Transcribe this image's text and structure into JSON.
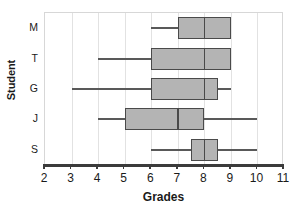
{
  "chart_data": {
    "type": "box",
    "title": "",
    "xlabel": "Grades",
    "ylabel": "Student",
    "orientation": "horizontal",
    "xlim": [
      2,
      11
    ],
    "xticks": [
      2,
      3,
      4,
      5,
      6,
      7,
      8,
      9,
      10,
      11
    ],
    "xtick_labels": [
      "2",
      "3",
      "4",
      "5",
      "6",
      "7",
      "8",
      "9",
      "10",
      "11"
    ],
    "grid": true,
    "legend": "none",
    "categories": [
      "M",
      "T",
      "G",
      "J",
      "S"
    ],
    "boxes": [
      {
        "category": "M",
        "whisker_low": 6,
        "q1": 7,
        "median": 8,
        "q3": 9,
        "whisker_high": 9
      },
      {
        "category": "T",
        "whisker_low": 4,
        "q1": 6,
        "median": 8,
        "q3": 9,
        "whisker_high": 9
      },
      {
        "category": "G",
        "whisker_low": 3,
        "q1": 6,
        "median": 8,
        "q3": 8.5,
        "whisker_high": 9
      },
      {
        "category": "J",
        "whisker_low": 4,
        "q1": 5,
        "median": 7,
        "q3": 8,
        "whisker_high": 10
      },
      {
        "category": "S",
        "whisker_low": 6,
        "q1": 7.5,
        "median": 8,
        "q3": 8.5,
        "whisker_high": 10
      }
    ],
    "colors": {
      "box_fill": "#b4b4b4",
      "box_edge": "#4a4a4a",
      "whisker": "#595959",
      "gridline": "#e2e2e2",
      "axis": "#3b3b3b",
      "text": "#1a1a1a",
      "background": "#ffffff"
    }
  }
}
